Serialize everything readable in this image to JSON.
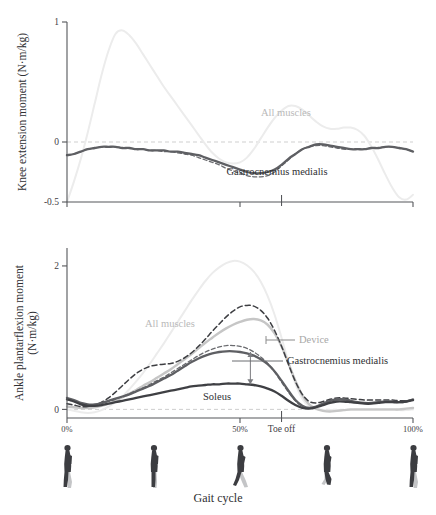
{
  "figure": {
    "x_axis_title": "Gait cycle",
    "x_ticks": [
      {
        "label": "0%",
        "pct": 0
      },
      {
        "label": "50%",
        "pct": 50
      },
      {
        "label": "Toe off",
        "pct": 62
      },
      {
        "label": "100%",
        "pct": 100
      }
    ]
  },
  "panels": [
    {
      "id": "knee",
      "y_axis_title": "Knee extension moment (N·m/kg)",
      "y_axis_title_lines": [
        "Knee extension moment (N·m/kg)"
      ],
      "y_ticks": [
        "1",
        "0",
        "-0.5"
      ],
      "labels": [
        {
          "name": "All muscles",
          "text": "All muscles",
          "color": "#b9b9b9"
        },
        {
          "name": "Gastrocnemius medialis",
          "text": "Gastrocnemius medialis",
          "color": "#2f3033"
        }
      ]
    },
    {
      "id": "ankle",
      "y_axis_title": "Ankle plantarflexion moment (N·m/kg)",
      "y_axis_title_lines": [
        "Ankle plantarflexion moment",
        "(N·m/kg)"
      ],
      "y_ticks": [
        "2",
        "0"
      ],
      "labels": [
        {
          "name": "All muscles",
          "text": "All muscles",
          "color": "#b9b9b9"
        },
        {
          "name": "Device",
          "text": "Device",
          "color": "#a8a8a8"
        },
        {
          "name": "Gastrocnemius medialis",
          "text": "Gastrocnemius medialis",
          "color": "#2f3033"
        },
        {
          "name": "Soleus",
          "text": "Soleus",
          "color": "#2f3033"
        }
      ]
    }
  ],
  "chart_data": [
    {
      "type": "line",
      "panel": "knee",
      "title": "",
      "xlabel": "Gait cycle",
      "ylabel": "Knee extension moment (N·m/kg)",
      "xlim": [
        0,
        100
      ],
      "ylim": [
        -0.5,
        1
      ],
      "yticks": [
        1,
        0,
        -0.5
      ],
      "xticks": [
        0,
        50,
        62,
        100
      ],
      "xticklabels": [
        "0%",
        "50%",
        "Toe off",
        "100%"
      ],
      "grid": false,
      "zero_line": true,
      "legend": "inline-annotations",
      "x": [
        0,
        2,
        4,
        6,
        8,
        10,
        12,
        14,
        16,
        18,
        20,
        22,
        24,
        26,
        28,
        30,
        32,
        34,
        36,
        38,
        40,
        42,
        44,
        46,
        48,
        50,
        52,
        54,
        56,
        58,
        60,
        62,
        64,
        66,
        68,
        70,
        72,
        74,
        76,
        78,
        80,
        82,
        84,
        86,
        88,
        90,
        92,
        94,
        96,
        98,
        100
      ],
      "series": [
        {
          "name": "All muscles",
          "style": "solid",
          "color": "#ececec",
          "values": [
            -0.5,
            -0.33,
            -0.14,
            0.08,
            0.32,
            0.56,
            0.76,
            0.9,
            0.93,
            0.89,
            0.82,
            0.73,
            0.64,
            0.55,
            0.46,
            0.38,
            0.3,
            0.22,
            0.14,
            0.06,
            -0.02,
            -0.09,
            -0.14,
            -0.17,
            -0.18,
            -0.17,
            -0.13,
            -0.06,
            0.03,
            0.12,
            0.2,
            0.26,
            0.3,
            0.3,
            0.27,
            0.22,
            0.17,
            0.13,
            0.11,
            0.11,
            0.12,
            0.12,
            0.1,
            0.05,
            -0.04,
            -0.15,
            -0.27,
            -0.38,
            -0.46,
            -0.48,
            -0.44
          ]
        },
        {
          "name": "Gastrocnemius medialis",
          "style": "solid",
          "color": "#5e5f63",
          "values": [
            -0.11,
            -0.1,
            -0.08,
            -0.06,
            -0.05,
            -0.04,
            -0.04,
            -0.04,
            -0.05,
            -0.05,
            -0.06,
            -0.06,
            -0.07,
            -0.07,
            -0.07,
            -0.08,
            -0.08,
            -0.09,
            -0.1,
            -0.11,
            -0.13,
            -0.15,
            -0.17,
            -0.19,
            -0.21,
            -0.23,
            -0.25,
            -0.26,
            -0.26,
            -0.25,
            -0.23,
            -0.19,
            -0.14,
            -0.1,
            -0.06,
            -0.04,
            -0.02,
            -0.02,
            -0.03,
            -0.04,
            -0.05,
            -0.06,
            -0.06,
            -0.06,
            -0.05,
            -0.05,
            -0.04,
            -0.04,
            -0.05,
            -0.06,
            -0.08
          ]
        },
        {
          "name": "Gastrocnemius medialis (dashed)",
          "style": "dashed",
          "color": "#3d3e42",
          "values": [
            -0.11,
            -0.1,
            -0.08,
            -0.06,
            -0.05,
            -0.04,
            -0.04,
            -0.04,
            -0.05,
            -0.05,
            -0.06,
            -0.06,
            -0.07,
            -0.07,
            -0.08,
            -0.08,
            -0.09,
            -0.1,
            -0.11,
            -0.13,
            -0.15,
            -0.17,
            -0.19,
            -0.22,
            -0.24,
            -0.26,
            -0.28,
            -0.29,
            -0.29,
            -0.28,
            -0.25,
            -0.2,
            -0.15,
            -0.1,
            -0.06,
            -0.04,
            -0.03,
            -0.03,
            -0.04,
            -0.05,
            -0.06,
            -0.06,
            -0.06,
            -0.06,
            -0.05,
            -0.05,
            -0.04,
            -0.04,
            -0.05,
            -0.06,
            -0.08
          ]
        }
      ]
    },
    {
      "type": "line",
      "panel": "ankle",
      "title": "",
      "xlabel": "Gait cycle",
      "ylabel": "Ankle plantarflexion moment (N·m/kg)",
      "xlim": [
        0,
        100
      ],
      "ylim": [
        -0.12,
        2.25
      ],
      "yticks": [
        2,
        0
      ],
      "xticks": [
        0,
        50,
        62,
        100
      ],
      "xticklabels": [
        "0%",
        "50%",
        "Toe off",
        "100%"
      ],
      "grid": false,
      "zero_line": true,
      "legend": "inline-annotations",
      "x": [
        0,
        2,
        4,
        6,
        8,
        10,
        12,
        14,
        16,
        18,
        20,
        22,
        24,
        26,
        28,
        30,
        32,
        34,
        36,
        38,
        40,
        42,
        44,
        46,
        48,
        50,
        52,
        54,
        56,
        58,
        60,
        62,
        64,
        66,
        68,
        70,
        72,
        74,
        76,
        78,
        80,
        82,
        84,
        86,
        88,
        90,
        92,
        94,
        96,
        98,
        100
      ],
      "series": [
        {
          "name": "All muscles",
          "style": "solid",
          "color": "#ececec",
          "values": [
            0.0,
            -0.02,
            -0.04,
            -0.05,
            -0.04,
            -0.01,
            0.04,
            0.1,
            0.18,
            0.28,
            0.39,
            0.51,
            0.64,
            0.78,
            0.92,
            1.07,
            1.22,
            1.37,
            1.52,
            1.66,
            1.79,
            1.9,
            1.98,
            2.04,
            2.07,
            2.06,
            2.01,
            1.92,
            1.78,
            1.58,
            1.32,
            1.0,
            0.66,
            0.36,
            0.15,
            0.04,
            0.0,
            -0.01,
            -0.01,
            -0.01,
            -0.01,
            -0.01,
            -0.01,
            -0.01,
            -0.01,
            -0.01,
            -0.01,
            -0.01,
            -0.01,
            -0.01,
            0.0
          ]
        },
        {
          "name": "Device",
          "style": "solid",
          "color": "#c6c6c6",
          "values": [
            0.04,
            0.03,
            0.02,
            0.02,
            0.03,
            0.05,
            0.08,
            0.12,
            0.17,
            0.22,
            0.27,
            0.33,
            0.38,
            0.44,
            0.5,
            0.56,
            0.63,
            0.7,
            0.77,
            0.85,
            0.93,
            1.0,
            1.07,
            1.13,
            1.18,
            1.22,
            1.25,
            1.26,
            1.24,
            1.18,
            1.06,
            0.88,
            0.64,
            0.4,
            0.2,
            0.07,
            0.01,
            -0.02,
            -0.03,
            -0.02,
            -0.01,
            0.0,
            0.0,
            0.0,
            0.0,
            0.0,
            0.0,
            0.0,
            0.0,
            0.01,
            0.02
          ]
        },
        {
          "name": "Gastrocnemius medialis",
          "style": "solid",
          "color": "#5e5f63",
          "values": [
            0.16,
            0.13,
            0.09,
            0.07,
            0.07,
            0.09,
            0.12,
            0.15,
            0.18,
            0.21,
            0.25,
            0.29,
            0.33,
            0.38,
            0.43,
            0.48,
            0.54,
            0.6,
            0.66,
            0.71,
            0.75,
            0.78,
            0.8,
            0.81,
            0.81,
            0.8,
            0.78,
            0.75,
            0.7,
            0.63,
            0.53,
            0.4,
            0.26,
            0.13,
            0.05,
            0.02,
            0.04,
            0.08,
            0.12,
            0.14,
            0.14,
            0.12,
            0.1,
            0.09,
            0.09,
            0.1,
            0.11,
            0.11,
            0.1,
            0.11,
            0.14
          ]
        },
        {
          "name": "Soleus",
          "style": "solid",
          "color": "#3f4044",
          "values": [
            0.14,
            0.11,
            0.07,
            0.05,
            0.05,
            0.06,
            0.08,
            0.1,
            0.12,
            0.14,
            0.16,
            0.18,
            0.2,
            0.22,
            0.24,
            0.26,
            0.28,
            0.3,
            0.32,
            0.33,
            0.34,
            0.35,
            0.35,
            0.36,
            0.36,
            0.36,
            0.35,
            0.34,
            0.32,
            0.29,
            0.25,
            0.19,
            0.12,
            0.06,
            0.02,
            0.01,
            0.03,
            0.06,
            0.09,
            0.11,
            0.11,
            0.1,
            0.09,
            0.08,
            0.08,
            0.09,
            0.1,
            0.1,
            0.1,
            0.11,
            0.13
          ]
        },
        {
          "name": "All muscles (dashed)",
          "style": "dashed",
          "color": "#3d3e42",
          "values": [
            0.08,
            0.06,
            0.04,
            0.04,
            0.06,
            0.1,
            0.16,
            0.24,
            0.33,
            0.42,
            0.5,
            0.56,
            0.6,
            0.62,
            0.63,
            0.64,
            0.67,
            0.72,
            0.79,
            0.88,
            0.98,
            1.09,
            1.19,
            1.29,
            1.37,
            1.43,
            1.45,
            1.44,
            1.38,
            1.27,
            1.1,
            0.88,
            0.63,
            0.39,
            0.21,
            0.11,
            0.09,
            0.11,
            0.14,
            0.16,
            0.16,
            0.15,
            0.14,
            0.13,
            0.13,
            0.13,
            0.13,
            0.13,
            0.12,
            0.12,
            0.13
          ]
        },
        {
          "name": "Gastrocnemius medialis (dashed)",
          "style": "dashed",
          "color": "#6a6b6f",
          "values": [
            0.14,
            0.11,
            0.08,
            0.06,
            0.06,
            0.08,
            0.11,
            0.14,
            0.18,
            0.22,
            0.26,
            0.3,
            0.35,
            0.4,
            0.45,
            0.51,
            0.57,
            0.63,
            0.69,
            0.75,
            0.8,
            0.84,
            0.87,
            0.89,
            0.89,
            0.88,
            0.85,
            0.8,
            0.73,
            0.64,
            0.52,
            0.38,
            0.24,
            0.12,
            0.04,
            0.02,
            0.04,
            0.08,
            0.12,
            0.14,
            0.14,
            0.12,
            0.1,
            0.09,
            0.09,
            0.1,
            0.11,
            0.11,
            0.1,
            0.11,
            0.14
          ]
        }
      ],
      "annotations": [
        {
          "name": "soleus-gm-difference-arrow",
          "type": "double-arrow",
          "x_pct": 53,
          "y_from": 0.8,
          "y_to": 0.35
        }
      ]
    }
  ],
  "silhouettes": [
    {
      "name": "gait-figure-0",
      "pct": 0
    },
    {
      "name": "gait-figure-25",
      "pct": 25
    },
    {
      "name": "gait-figure-50",
      "pct": 50
    },
    {
      "name": "gait-figure-75",
      "pct": 75
    },
    {
      "name": "gait-figure-100",
      "pct": 100
    }
  ]
}
